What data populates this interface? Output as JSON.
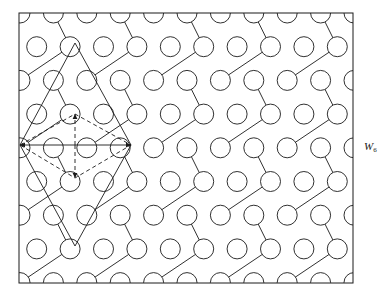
{
  "figure": {
    "kind": "crystal-lattice-schematic",
    "background": "#ffffff",
    "line_color": "#1a1a1a",
    "frame": {
      "x": 19,
      "y": 13,
      "width": 334,
      "height": 270,
      "stroke_width": 1
    },
    "atom": {
      "radius": 10,
      "stroke_width": 1,
      "fill": "none"
    },
    "lattice": {
      "col_spacing": 33.4,
      "row_spacing": 33.7,
      "row_offset": 16.7,
      "origin_x": 19,
      "origin_y": 13
    },
    "solid_cell": {
      "stroke_dash": "none",
      "vertices": [
        [
          20,
          145
        ],
        [
          75,
          43
        ],
        [
          131,
          145
        ],
        [
          75,
          246
        ]
      ]
    },
    "dashed_cell": {
      "stroke_dash": "4,3",
      "vertices": [
        [
          20,
          145
        ],
        [
          75,
          114
        ],
        [
          131,
          145
        ],
        [
          75,
          178
        ]
      ]
    },
    "vectors": [
      {
        "name": "a1",
        "from": [
          75,
          145
        ],
        "to": [
          20,
          145
        ],
        "style": "solid"
      },
      {
        "name": "a2",
        "from": [
          75,
          145
        ],
        "to": [
          131,
          145
        ],
        "style": "solid"
      },
      {
        "name": "b1",
        "from": [
          75,
          145
        ],
        "to": [
          75,
          114
        ],
        "style": "dashed"
      },
      {
        "name": "b2",
        "from": [
          75,
          145
        ],
        "to": [
          75,
          178
        ],
        "style": "dashed"
      }
    ],
    "labels": [
      {
        "name": "unit-cell-label",
        "text": "W",
        "subscript": "6",
        "x": 364,
        "y": 141
      }
    ]
  }
}
